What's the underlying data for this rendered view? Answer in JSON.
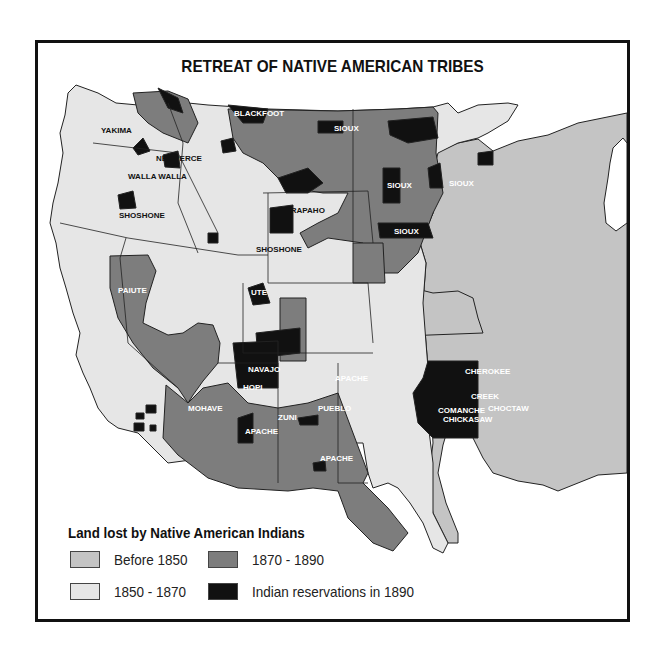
{
  "title": "RETREAT OF NATIVE AMERICAN TRIBES",
  "colors": {
    "before_1850": "#c4c4c4",
    "1850_1870": "#e6e6e6",
    "1870_1890": "#7d7d7d",
    "reservations_1890": "#111111",
    "water": "#ffffff",
    "border": "#222222"
  },
  "tribe_labels": [
    {
      "name": "SPOKANE",
      "x": 118,
      "y": 38,
      "color": "white"
    },
    {
      "name": "BLACKFOOT",
      "x": 196,
      "y": 73,
      "color": "white"
    },
    {
      "name": "SIOUX",
      "x": 296,
      "y": 88,
      "color": "white"
    },
    {
      "name": "SIOUX",
      "x": 420,
      "y": 50,
      "color": "white"
    },
    {
      "name": "YAKIMA",
      "x": 63,
      "y": 90,
      "color": "black"
    },
    {
      "name": "NEZ PERCE",
      "x": 118,
      "y": 118,
      "color": "black"
    },
    {
      "name": "WALLA WALLA",
      "x": 90,
      "y": 136,
      "color": "black"
    },
    {
      "name": "SIOUX",
      "x": 349,
      "y": 145,
      "color": "white"
    },
    {
      "name": "SIOUX",
      "x": 411,
      "y": 143,
      "color": "white"
    },
    {
      "name": "SHOSHONE",
      "x": 81,
      "y": 175,
      "color": "black"
    },
    {
      "name": "ARAPAHO",
      "x": 247,
      "y": 170,
      "color": "black"
    },
    {
      "name": "SIOUX",
      "x": 356,
      "y": 191,
      "color": "white"
    },
    {
      "name": "SHOSHONE",
      "x": 218,
      "y": 209,
      "color": "black"
    },
    {
      "name": "PAIUTE",
      "x": 80,
      "y": 250,
      "color": "white"
    },
    {
      "name": "UTE",
      "x": 213,
      "y": 252,
      "color": "white"
    },
    {
      "name": "NAVAJO",
      "x": 210,
      "y": 329,
      "color": "white"
    },
    {
      "name": "HOPI",
      "x": 205,
      "y": 347,
      "color": "white"
    },
    {
      "name": "APACHE",
      "x": 297,
      "y": 338,
      "color": "white"
    },
    {
      "name": "CHEROKEE",
      "x": 427,
      "y": 331,
      "color": "white"
    },
    {
      "name": "CREEK",
      "x": 433,
      "y": 356,
      "color": "white"
    },
    {
      "name": "CHOCTAW",
      "x": 450,
      "y": 368,
      "color": "white"
    },
    {
      "name": "COMANCHE",
      "x": 400,
      "y": 370,
      "color": "white"
    },
    {
      "name": "CHICKASAW",
      "x": 405,
      "y": 379,
      "color": "white"
    },
    {
      "name": "MOHAVE",
      "x": 150,
      "y": 368,
      "color": "white"
    },
    {
      "name": "ZUNI",
      "x": 240,
      "y": 377,
      "color": "white"
    },
    {
      "name": "PUEBLO",
      "x": 280,
      "y": 368,
      "color": "white"
    },
    {
      "name": "APACHE",
      "x": 207,
      "y": 391,
      "color": "white"
    },
    {
      "name": "APACHE",
      "x": 282,
      "y": 418,
      "color": "white"
    }
  ],
  "legend": {
    "title": "Land lost by Native American Indians",
    "items": [
      {
        "label": "Before 1850",
        "color": "#c4c4c4"
      },
      {
        "label": "1870 - 1890",
        "color": "#7d7d7d"
      },
      {
        "label": "1850 - 1870",
        "color": "#e6e6e6"
      },
      {
        "label": "Indian reservations in 1890",
        "color": "#111111"
      }
    ]
  }
}
